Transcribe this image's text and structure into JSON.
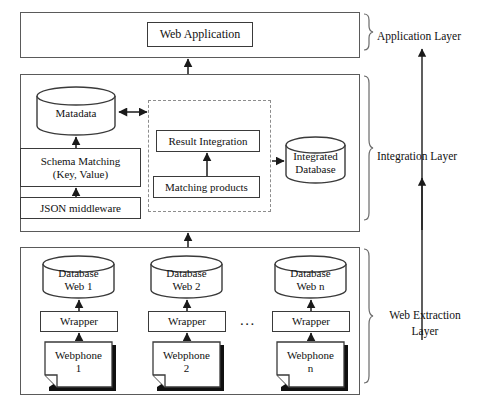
{
  "diagram": {
    "layers": [
      {
        "id": "application",
        "label": "Application Layer"
      },
      {
        "id": "integration",
        "label": "Integration Layer"
      },
      {
        "id": "extraction",
        "label_line1": "Web Extraction",
        "label_line2": "Layer"
      }
    ]
  },
  "application_layer": {
    "web_application": "Web Application"
  },
  "integration_layer": {
    "metadata": "Matadata",
    "schema_matching_line1": "Schema Matching",
    "schema_matching_line2": "(Key, Value)",
    "json_middleware": "JSON  middleware",
    "result_integration": "Result Integration",
    "matching_products": "Matching products",
    "integrated_database_line1": "Integrated",
    "integrated_database_line2": "Database"
  },
  "extraction_layer": {
    "ellipsis": "...",
    "columns": [
      {
        "database_line1": "Database",
        "database_line2": "Web 1",
        "wrapper": "Wrapper",
        "source_line1": "Webphone",
        "source_line2": "1"
      },
      {
        "database_line1": "Database",
        "database_line2": "Web 2",
        "wrapper": "Wrapper",
        "source_line1": "Webphone",
        "source_line2": "2"
      },
      {
        "database_line1": "Database",
        "database_line2": "Web n",
        "wrapper": "Wrapper",
        "source_line1": "Webphone",
        "source_line2": "n"
      }
    ]
  },
  "colors": {
    "stroke": "#3a3a3a",
    "layer_stroke": "#5a5a5a",
    "dashed_stroke": "#8d8d8d",
    "shadow": "#101010",
    "background": "#ffffff"
  }
}
